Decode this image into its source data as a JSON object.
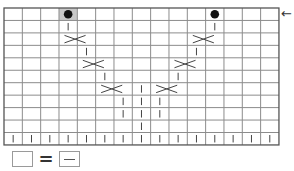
{
  "chart": {
    "title": "",
    "type": "knitting-chart",
    "columns": 15,
    "rows": 11,
    "origin": {
      "x": 4,
      "y": 8
    },
    "cell_width": 18.33,
    "cell_height": 12.45,
    "colors": {
      "grid": "#8c8c8c",
      "border": "#555555",
      "symbol": "#444444",
      "shaded_cell": "#c8c8c8",
      "bobble": "#111111"
    },
    "shaded_cells": [
      {
        "row": 0,
        "col": 3
      }
    ],
    "bobbles": [
      {
        "row": 0,
        "col": 3
      },
      {
        "row": 0,
        "col": 11
      }
    ],
    "knit_marks": [
      {
        "row": 1,
        "col": 3
      },
      {
        "row": 3,
        "col": 4
      },
      {
        "row": 5,
        "col": 5
      },
      {
        "row": 1,
        "col": 11
      },
      {
        "row": 3,
        "col": 10
      },
      {
        "row": 5,
        "col": 9
      },
      {
        "row": 6,
        "col": 7
      },
      {
        "row": 7,
        "col": 6
      },
      {
        "row": 7,
        "col": 7
      },
      {
        "row": 7,
        "col": 8
      },
      {
        "row": 8,
        "col": 6
      },
      {
        "row": 8,
        "col": 7
      },
      {
        "row": 8,
        "col": 8
      },
      {
        "row": 9,
        "col": 7
      },
      {
        "row": 10,
        "col": 0
      },
      {
        "row": 10,
        "col": 1
      },
      {
        "row": 10,
        "col": 2
      },
      {
        "row": 10,
        "col": 3
      },
      {
        "row": 10,
        "col": 4
      },
      {
        "row": 10,
        "col": 5
      },
      {
        "row": 10,
        "col": 6
      },
      {
        "row": 10,
        "col": 7
      },
      {
        "row": 10,
        "col": 8
      },
      {
        "row": 10,
        "col": 9
      },
      {
        "row": 10,
        "col": 10
      },
      {
        "row": 10,
        "col": 11
      },
      {
        "row": 10,
        "col": 12
      },
      {
        "row": 10,
        "col": 13
      },
      {
        "row": 10,
        "col": 14
      }
    ],
    "cables": [
      {
        "row": 2,
        "from_col": 3,
        "to_col": 4,
        "direction": "right"
      },
      {
        "row": 4,
        "from_col": 4,
        "to_col": 5,
        "direction": "right"
      },
      {
        "row": 6,
        "from_col": 5,
        "to_col": 6,
        "direction": "right"
      },
      {
        "row": 2,
        "from_col": 10,
        "to_col": 11,
        "direction": "left"
      },
      {
        "row": 4,
        "from_col": 9,
        "to_col": 10,
        "direction": "left"
      },
      {
        "row": 6,
        "from_col": 8,
        "to_col": 9,
        "direction": "left"
      }
    ]
  },
  "row_indicator": {
    "icon": "arrow-left-icon",
    "glyph": "←",
    "row": 0
  },
  "legend": {
    "left_symbol": "empty-cell",
    "equals": "=",
    "right_symbol": "purl-dash-cell"
  }
}
